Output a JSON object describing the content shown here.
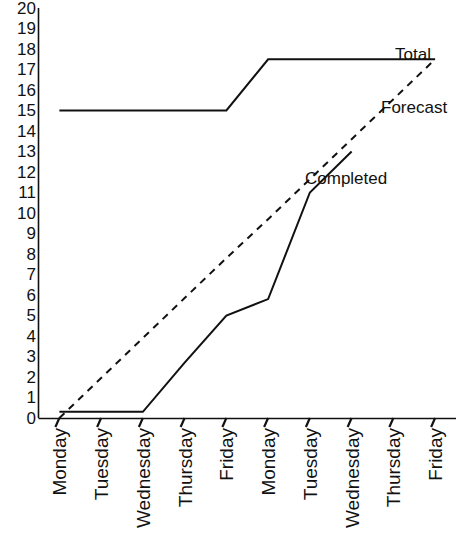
{
  "chart_data": {
    "type": "line",
    "title": "",
    "xlabel": "",
    "ylabel": "",
    "grid": false,
    "legend_position": "inline-right",
    "ylim": [
      0,
      20
    ],
    "yticks": [
      20,
      19,
      18,
      17,
      16,
      15,
      14,
      13,
      12,
      11,
      10,
      9,
      8,
      7,
      6,
      5,
      4,
      3,
      2,
      1,
      0
    ],
    "categories": [
      "Monday",
      "Tuesday",
      "Wednesday",
      "Thursday",
      "Friday",
      "Monday",
      "Tuesday",
      "Wednesday",
      "Thursday",
      "Friday"
    ],
    "series": [
      {
        "name": "Total",
        "style": "solid",
        "color": "#000000",
        "values": [
          15,
          15,
          15,
          15,
          15,
          17.5,
          17.5,
          17.5,
          17.5,
          17.5
        ]
      },
      {
        "name": "Forecast",
        "style": "dashed",
        "color": "#000000",
        "values": [
          0,
          1.95,
          3.9,
          5.85,
          7.8,
          9.7,
          11.65,
          13.6,
          15.55,
          17.5
        ]
      },
      {
        "name": "Completed",
        "style": "solid",
        "color": "#000000",
        "values": [
          0.3,
          0.3,
          0.3,
          2.7,
          5.0,
          5.8,
          11.0,
          13.0,
          null,
          null
        ]
      }
    ]
  },
  "labels": {
    "total": "Total",
    "forecast": "Forecast",
    "completed": "Completed"
  },
  "axis": {
    "y_top_value": "20",
    "y_bottom_value": "0"
  }
}
